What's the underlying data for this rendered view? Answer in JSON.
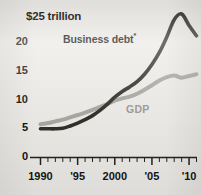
{
  "chart_data": {
    "type": "line",
    "title": "",
    "subtitle": "",
    "xlabel": "",
    "ylabel": "",
    "y_axis_top_label": "$25 trillion",
    "y_tick_labels": [
      "20",
      "15",
      "10",
      "5",
      "0"
    ],
    "y_tick_values": [
      20,
      15,
      10,
      5,
      0
    ],
    "ylim": [
      0,
      25
    ],
    "xlim": [
      1990,
      2011
    ],
    "x_tick_labels": [
      "1990",
      "'95",
      "2000",
      "'05",
      "'10"
    ],
    "x_tick_values": [
      1990,
      1995,
      2000,
      2005,
      2010
    ],
    "grid": false,
    "legend_position": "inline-annotations",
    "x": [
      1990,
      1991,
      1992,
      1993,
      1994,
      1995,
      1996,
      1997,
      1998,
      1999,
      2000,
      2001,
      2002,
      2003,
      2004,
      2005,
      2006,
      2007,
      2008,
      2009,
      2010,
      2011
    ],
    "series": [
      {
        "name": "Business debt",
        "label": "Business debt",
        "footnote_marker": "*",
        "color": "#33302b",
        "values": [
          5.0,
          5.0,
          5.0,
          5.1,
          5.5,
          6.0,
          6.6,
          7.3,
          8.2,
          9.3,
          10.5,
          11.5,
          12.3,
          13.2,
          14.5,
          16.2,
          18.3,
          21.0,
          24.0,
          25.0,
          23.0,
          21.2
        ]
      },
      {
        "name": "GDP",
        "label": "GDP",
        "color": "#a9a7a2",
        "values": [
          5.8,
          6.0,
          6.3,
          6.6,
          7.0,
          7.4,
          7.8,
          8.3,
          8.8,
          9.3,
          9.9,
          10.3,
          10.6,
          11.1,
          11.8,
          12.6,
          13.4,
          14.0,
          14.3,
          13.9,
          14.2,
          14.5
        ]
      }
    ]
  },
  "annotations": {
    "business_debt_label": "Business debt",
    "business_debt_footnote_marker": "*",
    "gdp_label": "GDP"
  },
  "colors": {
    "background": "#eceae6",
    "axis": "#26231e",
    "business_debt": "#33302b",
    "gdp": "#a9a7a2",
    "text": "#16140f"
  }
}
